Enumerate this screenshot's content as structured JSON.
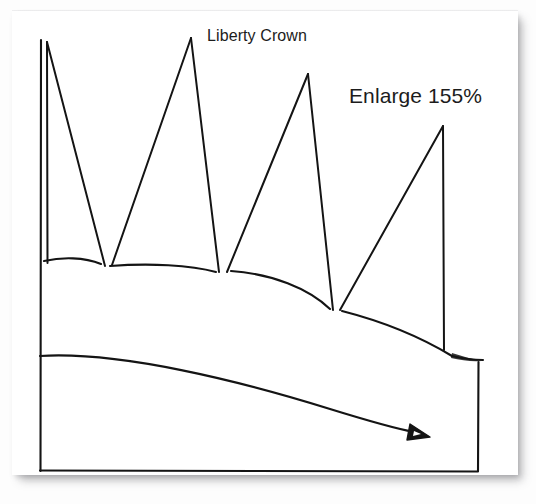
{
  "document": {
    "type": "scanned-card-photo",
    "background_color": "#fdfdfd",
    "card_color": "#ffffff",
    "ink_color": "#141414"
  },
  "labels": {
    "title": "Liberty Crown",
    "enlarge": "Enlarge 155%"
  },
  "drawing": {
    "name": "liberty-crown-line-drawing",
    "frame": {
      "left": 40,
      "top": 40,
      "right": 478,
      "bottom": 471
    },
    "crown": {
      "spike_count": 4,
      "peaks": [
        {
          "x": 47,
          "y": 42
        },
        {
          "x": 191,
          "y": 38
        },
        {
          "x": 308,
          "y": 74
        },
        {
          "x": 443,
          "y": 126
        }
      ],
      "valleys": [
        {
          "x": 105,
          "y": 266
        },
        {
          "x": 219,
          "y": 272
        },
        {
          "x": 333,
          "y": 310
        }
      ],
      "band_start": {
        "x": 44,
        "y": 261
      },
      "band_end": {
        "x": 483,
        "y": 360
      }
    },
    "arc": {
      "start": {
        "x": 40,
        "y": 356
      },
      "end": {
        "x": 418,
        "y": 433
      },
      "arrowhead": "solid-triangle"
    }
  }
}
